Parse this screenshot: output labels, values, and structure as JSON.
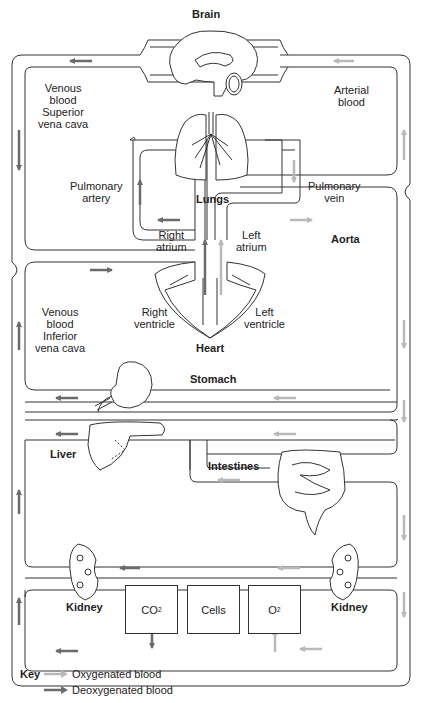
{
  "colors": {
    "oxygenated": "#b9b9b9",
    "deoxygenated": "#6b6b6b",
    "outline": "#333333"
  },
  "organs": {
    "brain": "Brain",
    "lungs": "Lungs",
    "heart": "Heart",
    "stomach": "Stomach",
    "liver": "Liver",
    "intestines": "Intestines",
    "kidney_left": "Kidney",
    "kidney_right": "Kidney",
    "aorta": "Aorta"
  },
  "labels": {
    "venous_superior": [
      "Venous",
      "blood",
      "Superior",
      "vena cava"
    ],
    "arterial": [
      "Arterial",
      "blood"
    ],
    "pulmonary_artery": [
      "Pulmonary",
      "artery"
    ],
    "pulmonary_vein": [
      "Pulmonary",
      "vein"
    ],
    "right_atrium": [
      "Right",
      "atrium"
    ],
    "left_atrium": [
      "Left",
      "atrium"
    ],
    "right_ventricle": [
      "Right",
      "ventricle"
    ],
    "left_ventricle": [
      "Left",
      "ventricle"
    ],
    "venous_inferior": [
      "Venous",
      "blood",
      "Inferior",
      "vena cava"
    ]
  },
  "boxes": {
    "co2": {
      "main": "CO",
      "sub": "2"
    },
    "cells": "Cells",
    "o2": {
      "main": "O",
      "sub": "2"
    }
  },
  "key": {
    "title": "Key",
    "oxygenated": "Oxygenated blood",
    "deoxygenated": "Deoxygenated blood"
  }
}
